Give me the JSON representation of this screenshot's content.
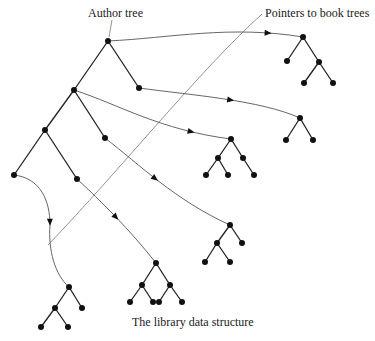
{
  "labels": {
    "author_tree": "Author tree",
    "pointers": "Pointers to book trees",
    "caption": "The library data structure"
  },
  "colors": {
    "node": "#111111",
    "edge": "#222222",
    "pointer": "#555555",
    "label_leader": "#777777"
  },
  "author_tree": {
    "nodes": [
      {
        "id": "a0",
        "x": 108,
        "y": 41
      },
      {
        "id": "a1",
        "x": 74,
        "y": 90
      },
      {
        "id": "a2",
        "x": 139,
        "y": 88
      },
      {
        "id": "a3",
        "x": 45,
        "y": 130
      },
      {
        "id": "a4",
        "x": 105,
        "y": 138
      },
      {
        "id": "a5",
        "x": 14,
        "y": 175
      },
      {
        "id": "a6",
        "x": 77,
        "y": 179
      }
    ],
    "edges": [
      [
        "a0",
        "a1"
      ],
      [
        "a0",
        "a2"
      ],
      [
        "a1",
        "a3"
      ],
      [
        "a1",
        "a4"
      ],
      [
        "a3",
        "a5"
      ],
      [
        "a3",
        "a6"
      ]
    ]
  },
  "book_trees": [
    {
      "name": "book-tree-1",
      "nodes": [
        [
          303,
          37
        ],
        [
          287,
          61
        ],
        [
          319,
          62
        ],
        [
          304,
          83
        ],
        [
          333,
          83
        ]
      ],
      "edges": [
        [
          0,
          1
        ],
        [
          0,
          2
        ],
        [
          2,
          3
        ],
        [
          2,
          4
        ]
      ]
    },
    {
      "name": "book-tree-2",
      "nodes": [
        [
          300,
          118
        ],
        [
          286,
          140
        ],
        [
          313,
          140
        ]
      ],
      "edges": [
        [
          0,
          1
        ],
        [
          0,
          2
        ]
      ]
    },
    {
      "name": "book-tree-3",
      "nodes": [
        [
          231,
          139
        ],
        [
          218,
          158
        ],
        [
          243,
          158
        ],
        [
          206,
          175
        ],
        [
          228,
          175
        ],
        [
          254,
          175
        ]
      ],
      "edges": [
        [
          0,
          1
        ],
        [
          0,
          2
        ],
        [
          1,
          3
        ],
        [
          1,
          4
        ],
        [
          2,
          5
        ]
      ]
    },
    {
      "name": "book-tree-4",
      "nodes": [
        [
          230,
          225
        ],
        [
          217,
          243
        ],
        [
          242,
          243
        ],
        [
          205,
          262
        ],
        [
          230,
          262
        ]
      ],
      "edges": [
        [
          0,
          1
        ],
        [
          0,
          2
        ],
        [
          1,
          3
        ],
        [
          1,
          4
        ]
      ]
    },
    {
      "name": "book-tree-5",
      "nodes": [
        [
          156,
          263
        ],
        [
          142,
          285
        ],
        [
          170,
          285
        ],
        [
          130,
          302
        ],
        [
          153,
          302
        ],
        [
          159,
          302
        ],
        [
          182,
          302
        ]
      ],
      "edges": [
        [
          0,
          1
        ],
        [
          0,
          2
        ],
        [
          1,
          3
        ],
        [
          1,
          4
        ],
        [
          2,
          5
        ],
        [
          2,
          6
        ]
      ]
    },
    {
      "name": "book-tree-6",
      "nodes": [
        [
          69,
          287
        ],
        [
          55,
          308
        ],
        [
          82,
          308
        ],
        [
          41,
          327
        ],
        [
          68,
          327
        ]
      ],
      "edges": [
        [
          0,
          1
        ],
        [
          0,
          2
        ],
        [
          1,
          3
        ],
        [
          1,
          4
        ]
      ]
    }
  ],
  "pointers": [
    {
      "from": "a0",
      "path": "M108,41 C170,38 230,25 303,37",
      "arrow": [
        268,
        32
      ]
    },
    {
      "from": "a2",
      "path": "M139,88 C190,95 260,100 300,118",
      "arrow": [
        230,
        101
      ]
    },
    {
      "from": "a1",
      "path": "M74,90 C120,105 160,130 231,139",
      "arrow": [
        190,
        133
      ]
    },
    {
      "from": "a4",
      "path": "M105,138 C140,165 175,200 230,225",
      "arrow": [
        153,
        180
      ]
    },
    {
      "from": "a6",
      "path": "M77,179 C100,200 130,230 156,263",
      "arrow": [
        115,
        217
      ]
    },
    {
      "from": "a5",
      "path": "M14,175 C40,178 50,200 50,225 C48,250 55,275 69,287",
      "arrow": [
        50,
        222
      ]
    }
  ],
  "leaders": {
    "author": "M112,20 L109,37",
    "pointers": "M262,14 C200,70 120,170 48,245"
  }
}
